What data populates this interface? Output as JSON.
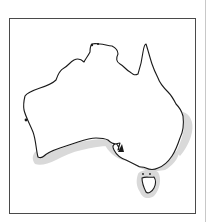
{
  "map": {
    "subject": "Australia",
    "type": "species distribution map",
    "frame_color": "#4a4a4a",
    "coastline_color": "#1a1a1a",
    "land_fill": "#ffffff",
    "range_fill": "#d6d6d6",
    "range_regions": [
      "south-west coast (Western Australia)",
      "southern coast (South Australia, Victoria)",
      "south-east coast (New South Wales)",
      "east coast (northern New South Wales / southern Queensland)",
      "Tasmania"
    ]
  }
}
